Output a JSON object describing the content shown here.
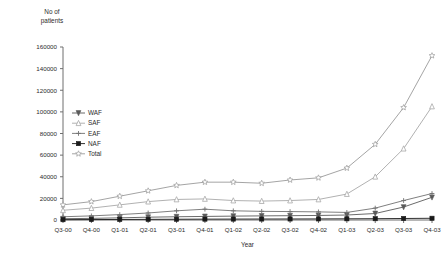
{
  "chart_data": {
    "type": "line",
    "title": "",
    "subtitle": "",
    "xlabel": "Year",
    "ylabel": "No of patients",
    "ylabel_line1": "No of",
    "ylabel_line2": "patients",
    "grid": false,
    "legend_position": "inside-left",
    "ylim": [
      0,
      160000
    ],
    "ytick_step": 20000,
    "ytick_labels": [
      "0",
      "20000",
      "40000",
      "60000",
      "80000",
      "100000",
      "120000",
      "140000",
      "160000"
    ],
    "ytick_values": [
      0,
      20000,
      40000,
      60000,
      80000,
      100000,
      120000,
      140000,
      160000
    ],
    "categories": [
      "Q3-00",
      "Q4-00",
      "Q1-01",
      "Q2-01",
      "Q3-01",
      "Q4-01",
      "Q1-02",
      "Q2-02",
      "Q3-02",
      "Q4-02",
      "Q1-03",
      "Q2-03",
      "Q3-03",
      "Q4-03"
    ],
    "series": [
      {
        "name": "WAF",
        "marker": "triangle-down",
        "color": "#5a5a5a",
        "values": [
          1200,
          1500,
          2000,
          2600,
          3000,
          3300,
          3600,
          3800,
          4000,
          4200,
          4600,
          6000,
          12000,
          21000
        ]
      },
      {
        "name": "SAF",
        "marker": "triangle-up",
        "color": "#a8a8a8",
        "values": [
          9000,
          11000,
          14000,
          17000,
          19000,
          19500,
          18000,
          17500,
          18000,
          19000,
          24000,
          40000,
          66000,
          105000
        ]
      },
      {
        "name": "EAF",
        "marker": "cross",
        "color": "#707070",
        "values": [
          3000,
          3800,
          5000,
          6500,
          8500,
          10000,
          8500,
          8000,
          7800,
          7500,
          7000,
          11000,
          18000,
          24500
        ]
      },
      {
        "name": "NAF",
        "marker": "square",
        "color": "#1a1a1a",
        "values": [
          300,
          400,
          500,
          600,
          700,
          800,
          850,
          900,
          950,
          1000,
          1100,
          1200,
          1400,
          1600
        ]
      },
      {
        "name": "Total",
        "marker": "star",
        "color": "#9a9a9a",
        "values": [
          14000,
          17000,
          22000,
          27000,
          32000,
          35000,
          35000,
          34000,
          37000,
          39000,
          48000,
          70000,
          104000,
          152000
        ]
      }
    ]
  },
  "legend": {
    "items": [
      {
        "label": "WAF"
      },
      {
        "label": "SAF"
      },
      {
        "label": "EAF"
      },
      {
        "label": "NAF"
      },
      {
        "label": "Total"
      }
    ]
  }
}
